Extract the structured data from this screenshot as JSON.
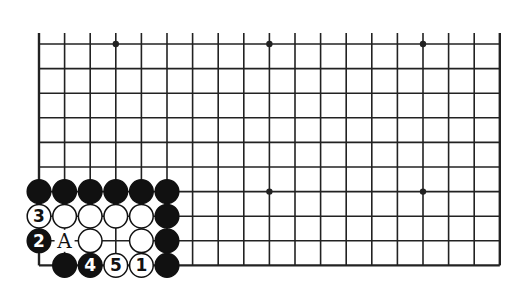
{
  "diagram": {
    "type": "go-board-fragment",
    "cols": 19,
    "rows": 10,
    "origin": {
      "x": 39,
      "y": 44
    },
    "spacing": {
      "x": 25.6,
      "y": 24.6
    },
    "top_edge_open": true,
    "line_color": "#222222",
    "star_points": [
      [
        3,
        0
      ],
      [
        9,
        0
      ],
      [
        15,
        0
      ],
      [
        9,
        6
      ],
      [
        15,
        6
      ]
    ],
    "stones": [
      {
        "col": 0,
        "row": 6,
        "color": "black",
        "label": ""
      },
      {
        "col": 1,
        "row": 6,
        "color": "black",
        "label": ""
      },
      {
        "col": 2,
        "row": 6,
        "color": "black",
        "label": ""
      },
      {
        "col": 3,
        "row": 6,
        "color": "black",
        "label": ""
      },
      {
        "col": 4,
        "row": 6,
        "color": "black",
        "label": ""
      },
      {
        "col": 5,
        "row": 6,
        "color": "black",
        "label": ""
      },
      {
        "col": 0,
        "row": 7,
        "color": "white",
        "label": "3"
      },
      {
        "col": 1,
        "row": 7,
        "color": "white",
        "label": ""
      },
      {
        "col": 2,
        "row": 7,
        "color": "white",
        "label": ""
      },
      {
        "col": 3,
        "row": 7,
        "color": "white",
        "label": ""
      },
      {
        "col": 4,
        "row": 7,
        "color": "white",
        "label": ""
      },
      {
        "col": 5,
        "row": 7,
        "color": "black",
        "label": ""
      },
      {
        "col": 0,
        "row": 8,
        "color": "black",
        "label": "2"
      },
      {
        "col": 2,
        "row": 8,
        "color": "white",
        "label": ""
      },
      {
        "col": 4,
        "row": 8,
        "color": "white",
        "label": ""
      },
      {
        "col": 5,
        "row": 8,
        "color": "black",
        "label": ""
      },
      {
        "col": 1,
        "row": 9,
        "color": "black",
        "label": ""
      },
      {
        "col": 2,
        "row": 9,
        "color": "black",
        "label": "4"
      },
      {
        "col": 3,
        "row": 9,
        "color": "white",
        "label": "5"
      },
      {
        "col": 4,
        "row": 9,
        "color": "white",
        "label": "1"
      },
      {
        "col": 5,
        "row": 9,
        "color": "black",
        "label": ""
      }
    ],
    "markers": [
      {
        "col": 1,
        "row": 8,
        "label": "A"
      }
    ]
  }
}
